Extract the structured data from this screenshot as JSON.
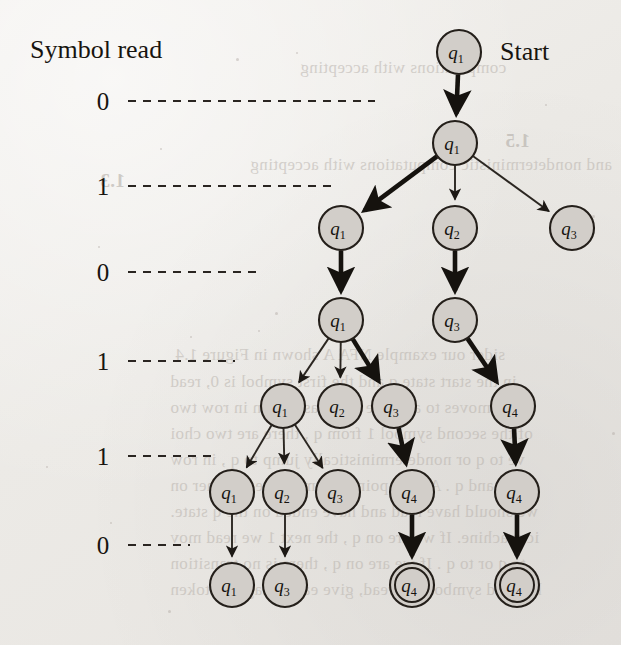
{
  "page": {
    "background_color": "#efecea",
    "ink_color": "#17140f",
    "node_fill": "#d2cec9",
    "node_stroke": "#241f1a"
  },
  "headings": {
    "symbol_read": "Symbol read",
    "start": "Start"
  },
  "symbol_labels": [
    {
      "text": "0",
      "y": 101,
      "line_end": 375
    },
    {
      "text": "1",
      "y": 186,
      "line_end": 333
    },
    {
      "text": "0",
      "y": 272,
      "line_end": 262
    },
    {
      "text": "1",
      "y": 361,
      "line_end": 235
    },
    {
      "text": "1",
      "y": 456,
      "line_end": 212
    },
    {
      "text": "0",
      "y": 545,
      "line_end": 190
    }
  ],
  "label_x": 103,
  "line_start_x": 128,
  "nodes": [
    {
      "id": "n0",
      "label": "q",
      "sub": "1",
      "x": 459,
      "y": 52,
      "accept": false
    },
    {
      "id": "n1",
      "label": "q",
      "sub": "1",
      "x": 455,
      "y": 143,
      "accept": false
    },
    {
      "id": "n2",
      "label": "q",
      "sub": "1",
      "x": 341,
      "y": 228,
      "accept": false
    },
    {
      "id": "n3",
      "label": "q",
      "sub": "2",
      "x": 455,
      "y": 228,
      "accept": false
    },
    {
      "id": "n4",
      "label": "q",
      "sub": "3",
      "x": 572,
      "y": 228,
      "accept": false
    },
    {
      "id": "n5",
      "label": "q",
      "sub": "1",
      "x": 341,
      "y": 320,
      "accept": false
    },
    {
      "id": "n6",
      "label": "q",
      "sub": "3",
      "x": 455,
      "y": 320,
      "accept": false
    },
    {
      "id": "n7",
      "label": "q",
      "sub": "1",
      "x": 283,
      "y": 406,
      "accept": false
    },
    {
      "id": "n8",
      "label": "q",
      "sub": "2",
      "x": 340,
      "y": 406,
      "accept": false
    },
    {
      "id": "n9",
      "label": "q",
      "sub": "3",
      "x": 394,
      "y": 406,
      "accept": false
    },
    {
      "id": "n10",
      "label": "q",
      "sub": "4",
      "x": 513,
      "y": 406,
      "accept": false
    },
    {
      "id": "n11",
      "label": "q",
      "sub": "1",
      "x": 232,
      "y": 492,
      "accept": false
    },
    {
      "id": "n12",
      "label": "q",
      "sub": "2",
      "x": 285,
      "y": 492,
      "accept": false
    },
    {
      "id": "n13",
      "label": "q",
      "sub": "3",
      "x": 338,
      "y": 492,
      "accept": false
    },
    {
      "id": "n14",
      "label": "q",
      "sub": "4",
      "x": 412,
      "y": 492,
      "accept": false
    },
    {
      "id": "n15",
      "label": "q",
      "sub": "4",
      "x": 517,
      "y": 492,
      "accept": false
    },
    {
      "id": "n16",
      "label": "q",
      "sub": "1",
      "x": 232,
      "y": 585,
      "accept": false
    },
    {
      "id": "n17",
      "label": "q",
      "sub": "3",
      "x": 285,
      "y": 585,
      "accept": false
    },
    {
      "id": "n18",
      "label": "q",
      "sub": "4",
      "x": 412,
      "y": 585,
      "accept": true
    },
    {
      "id": "n19",
      "label": "q",
      "sub": "4",
      "x": 517,
      "y": 585,
      "accept": true
    }
  ],
  "edges": [
    {
      "from": "n0",
      "to": "n1",
      "weight": "bold"
    },
    {
      "from": "n1",
      "to": "n2",
      "weight": "bold"
    },
    {
      "from": "n1",
      "to": "n3",
      "weight": "thin"
    },
    {
      "from": "n1",
      "to": "n4",
      "weight": "thin"
    },
    {
      "from": "n2",
      "to": "n5",
      "weight": "bold"
    },
    {
      "from": "n3",
      "to": "n6",
      "weight": "bold"
    },
    {
      "from": "n5",
      "to": "n7",
      "weight": "thin"
    },
    {
      "from": "n5",
      "to": "n8",
      "weight": "thin"
    },
    {
      "from": "n5",
      "to": "n9",
      "weight": "bold"
    },
    {
      "from": "n6",
      "to": "n10",
      "weight": "bold"
    },
    {
      "from": "n7",
      "to": "n11",
      "weight": "thin"
    },
    {
      "from": "n7",
      "to": "n12",
      "weight": "thin"
    },
    {
      "from": "n7",
      "to": "n13",
      "weight": "thin"
    },
    {
      "from": "n9",
      "to": "n14",
      "weight": "bold"
    },
    {
      "from": "n10",
      "to": "n15",
      "weight": "bold"
    },
    {
      "from": "n11",
      "to": "n16",
      "weight": "thin"
    },
    {
      "from": "n12",
      "to": "n17",
      "weight": "thin"
    },
    {
      "from": "n14",
      "to": "n18",
      "weight": "bold"
    },
    {
      "from": "n15",
      "to": "n19",
      "weight": "bold"
    }
  ],
  "node_radius": 22,
  "accept_inner_radius": 17,
  "ghost_text": [
    {
      "text": "computations with accepting",
      "x": 300,
      "y": 58,
      "bold": false
    },
    {
      "text": "1.5",
      "x": 505,
      "y": 130,
      "bold": true
    },
    {
      "text": "and nondeterministic computations with accepting",
      "x": 250,
      "y": 155,
      "bold": false
    },
    {
      "text": "sider our example NFA A  shown in Figure 1.4",
      "x": 175,
      "y": 345,
      "bold": false
    },
    {
      "text": "in the start state q  and the first symbol is 0, read",
      "x": 170,
      "y": 372,
      "bold": false
    },
    {
      "text": "ple moves to a single state, as shown in row two",
      "x": 170,
      "y": 398,
      "bold": false
    },
    {
      "text": "of the second symbol 1 from q  , there are two choi",
      "x": 170,
      "y": 424,
      "bold": false
    },
    {
      "text": "ve to q  or nondeterministically jump to q  , in row",
      "x": 170,
      "y": 450,
      "bold": false
    },
    {
      "text": "us, q  and q  . At this point, the machine is either on",
      "x": 170,
      "y": 476,
      "bold": false
    },
    {
      "text": "we should have read and have ended on the q state.",
      "x": 170,
      "y": 502,
      "bold": false
    },
    {
      "text": "ic machine. If we are on q  , the next 1 we read mov",
      "x": 170,
      "y": 528,
      "bold": false
    },
    {
      "text": "to q  or to q  . If we are on q  , there is no transition",
      "x": 170,
      "y": 554,
      "bold": false
    },
    {
      "text": "he third symbol 0 is read, give each imagined token",
      "x": 170,
      "y": 580,
      "bold": false
    },
    {
      "text": "1.3",
      "x": 100,
      "y": 170,
      "bold": true
    }
  ],
  "specks": [
    {
      "x": 236,
      "y": 58,
      "w": 3,
      "h": 3
    },
    {
      "x": 296,
      "y": 52,
      "w": 2,
      "h": 2
    },
    {
      "x": 160,
      "y": 148,
      "w": 2,
      "h": 2
    },
    {
      "x": 592,
      "y": 215,
      "w": 3,
      "h": 3
    },
    {
      "x": 98,
      "y": 246,
      "w": 2,
      "h": 2
    },
    {
      "x": 275,
      "y": 312,
      "w": 3,
      "h": 3
    },
    {
      "x": 190,
      "y": 336,
      "w": 2,
      "h": 2
    },
    {
      "x": 258,
      "y": 330,
      "w": 2,
      "h": 2
    },
    {
      "x": 612,
      "y": 432,
      "w": 3,
      "h": 3
    },
    {
      "x": 110,
      "y": 522,
      "w": 2,
      "h": 2
    },
    {
      "x": 545,
      "y": 104,
      "w": 2,
      "h": 2
    },
    {
      "x": 168,
      "y": 610,
      "w": 3,
      "h": 3
    },
    {
      "x": 46,
      "y": 466,
      "w": 2,
      "h": 2
    },
    {
      "x": 500,
      "y": 560,
      "w": 2,
      "h": 2
    }
  ]
}
